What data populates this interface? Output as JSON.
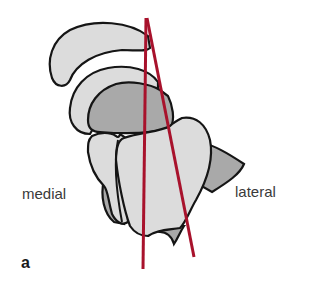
{
  "figure": {
    "panel_label": "a",
    "labels": {
      "medial": "medial",
      "lateral": "lateral"
    },
    "colors": {
      "background": "#ffffff",
      "light_bone": "#dcdcdc",
      "dark_bone": "#a9a9a9",
      "outline": "#151515",
      "axis_lines": "#a8122c",
      "text": "#3a3a3a"
    },
    "axis_lines": [
      {
        "name": "left-axis",
        "x1": 146,
        "y1": 18,
        "x2": 143,
        "y2": 269
      },
      {
        "name": "right-axis",
        "x1": 147,
        "y1": 18,
        "x2": 194,
        "y2": 257
      }
    ]
  }
}
